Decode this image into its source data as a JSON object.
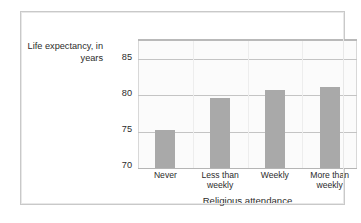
{
  "chart_data": {
    "type": "bar",
    "title": "",
    "xlabel": "Religious attendance",
    "ylabel": "Life expectancy, in years",
    "categories": [
      "Never",
      "Less than\nweekly",
      "Weekly",
      "More than\nweekly"
    ],
    "values": [
      75.2,
      79.6,
      80.7,
      81.2
    ],
    "ylim": [
      70,
      87.5
    ],
    "yticks": [
      70,
      75,
      80,
      85
    ],
    "ytick_labels": [
      "70",
      "75",
      "80",
      "85"
    ],
    "grid": true,
    "legend": "none",
    "bar_color": "#a9a9a9",
    "plot_background": "#fbfbfb",
    "gridline_color": "#c4c4c4",
    "text_color": "#2b2b2b",
    "frame_color": "#c9c9c9"
  }
}
